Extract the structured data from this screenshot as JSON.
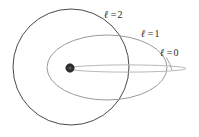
{
  "figure": {
    "width": 199,
    "height": 137,
    "background": "#ffffff"
  },
  "nucleus": {
    "name": "nucleus",
    "cx": 70,
    "cy": 68,
    "r": 4.2,
    "color": "#2f2f2f"
  },
  "orbits": [
    {
      "id": "l0",
      "quantum_number": 0,
      "shape": "degenerate-ellipse",
      "cx": 127,
      "cy": 68.5,
      "rx": 59,
      "ry": 3.6,
      "stroke": "#b9b9b9",
      "stroke_width": 1.0
    },
    {
      "id": "l1",
      "quantum_number": 1,
      "shape": "ellipse",
      "cx": 107,
      "cy": 67.5,
      "rx": 60,
      "ry": 32.5,
      "stroke": "#9a9a9a",
      "stroke_width": 1.0
    },
    {
      "id": "l2",
      "quantum_number": 2,
      "shape": "circle",
      "cx": 71,
      "cy": 67,
      "r": 58,
      "stroke": "#4a4a4a",
      "stroke_width": 1.0
    }
  ],
  "labels": {
    "l2": {
      "symbol": "ℓ",
      "equals": "=",
      "value": "2"
    },
    "l1": {
      "symbol": "ℓ",
      "equals": "=",
      "value": "1"
    },
    "l0": {
      "symbol": "ℓ",
      "equals": "=",
      "value": "0"
    }
  }
}
